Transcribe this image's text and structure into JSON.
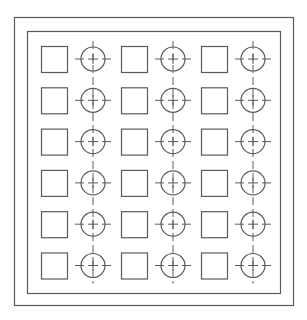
{
  "diagram": {
    "title": "",
    "stroke_color": "#5a5a5a",
    "outer_frame": {
      "x": 14,
      "y": 17,
      "w": 279,
      "h": 288
    },
    "inner_frame": {
      "x": 27,
      "y": 31,
      "w": 253,
      "h": 262
    },
    "grid": {
      "rows": 6,
      "columns": 3,
      "row_pitch": 41.3,
      "column_pitch": 80,
      "first_row_center_y": 59,
      "square": {
        "size": 26,
        "first_x": 41
      },
      "circle": {
        "radius": 12,
        "tick_extent": 18,
        "first_cx": 93
      }
    },
    "elements": [
      {
        "type": "square",
        "label": "square-marker"
      },
      {
        "type": "circle-crosshair",
        "label": "circle-crosshair-marker"
      }
    ],
    "circle_columns_connected_by": "dashed-vertical-line"
  }
}
